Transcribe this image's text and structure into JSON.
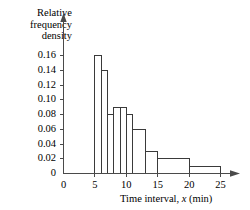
{
  "chart_data": {
    "type": "bar",
    "title": "",
    "subtitle": "",
    "xlabel_parts": {
      "pre": "Time interval, ",
      "italic": "x",
      "post": " (min)"
    },
    "xlabel": "Time interval, x (min)",
    "ylabel": "Relative\nfrequency\ndensity",
    "ylabel_lines": [
      "Relative",
      "frequency",
      "density"
    ],
    "xlim": [
      0,
      26.5
    ],
    "ylim": [
      0,
      0.172
    ],
    "grid": false,
    "legend": "none",
    "xticks": [
      0,
      5,
      10,
      15,
      20,
      25
    ],
    "xtick_labels": [
      "0",
      "5",
      "10",
      "15",
      "20",
      "25"
    ],
    "yticks": [
      0,
      0.02,
      0.04,
      0.06,
      0.08,
      0.1,
      0.12,
      0.14,
      0.16
    ],
    "ytick_labels": [
      "0",
      "0.02",
      "0.04",
      "0.06",
      "0.08",
      "0.10",
      "0.12",
      "0.14",
      "0.16"
    ],
    "bin_edges": [
      5,
      6,
      7,
      8,
      9,
      10,
      11,
      13,
      15,
      20,
      25
    ],
    "categories": [
      "5-6",
      "6-7",
      "7-8",
      "8-9",
      "9-10",
      "10-11",
      "11-13",
      "13-15",
      "15-20",
      "20-25"
    ],
    "values": [
      0.16,
      0.14,
      0.08,
      0.09,
      0.09,
      0.08,
      0.06,
      0.03,
      0.02,
      0.01
    ],
    "bars": [
      {
        "x0": 5,
        "x1": 6,
        "density": 0.16
      },
      {
        "x0": 6,
        "x1": 7,
        "density": 0.14
      },
      {
        "x0": 7,
        "x1": 8,
        "density": 0.08
      },
      {
        "x0": 8,
        "x1": 9,
        "density": 0.09
      },
      {
        "x0": 9,
        "x1": 10,
        "density": 0.09
      },
      {
        "x0": 10,
        "x1": 11,
        "density": 0.08
      },
      {
        "x0": 11,
        "x1": 13,
        "density": 0.06
      },
      {
        "x0": 13,
        "x1": 15,
        "density": 0.03
      },
      {
        "x0": 15,
        "x1": 20,
        "density": 0.02
      },
      {
        "x0": 20,
        "x1": 25,
        "density": 0.01
      }
    ],
    "colors": {
      "bar_fill": "#ffffff",
      "bar_stroke": "#3a3a3a",
      "axis": "#4a4a4a",
      "text": "#000000"
    }
  }
}
